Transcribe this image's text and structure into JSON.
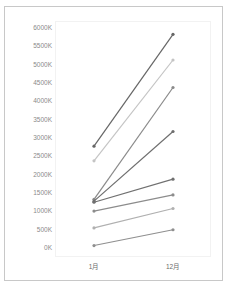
{
  "chart_data": {
    "type": "line",
    "title": "",
    "xlabel": "",
    "ylabel": "",
    "categories": [
      "1月",
      "12月"
    ],
    "yticks": [
      "0K",
      "500K",
      "1000K",
      "1500K",
      "2000K",
      "2500K",
      "3000K",
      "3500K",
      "4000K",
      "4500K",
      "5000K",
      "5500K",
      "6000K"
    ],
    "ylim": [
      0,
      6000
    ],
    "grid": false,
    "legend": "none",
    "series": [
      {
        "name": "series-1",
        "values": [
          2750,
          5800
        ],
        "color": "#666666"
      },
      {
        "name": "series-2",
        "values": [
          2350,
          5100
        ],
        "color": "#c4c4c4"
      },
      {
        "name": "series-3",
        "values": [
          1300,
          4350
        ],
        "color": "#8a8a8a"
      },
      {
        "name": "series-4",
        "values": [
          1250,
          3150
        ],
        "color": "#6e6e6e"
      },
      {
        "name": "series-5",
        "values": [
          1220,
          1850
        ],
        "color": "#707070"
      },
      {
        "name": "series-6",
        "values": [
          980,
          1420
        ],
        "color": "#8c8c8c"
      },
      {
        "name": "series-7",
        "values": [
          520,
          1050
        ],
        "color": "#b0b0b0"
      },
      {
        "name": "series-8",
        "values": [
          40,
          470
        ],
        "color": "#8f8f8f"
      }
    ]
  },
  "axis": {
    "y_labels": [
      "6000K",
      "5500K",
      "5000K",
      "4500K",
      "4000K",
      "3500K",
      "3000K",
      "2500K",
      "2000K",
      "1500K",
      "1000K",
      "500K",
      "0K"
    ],
    "x_labels": [
      "1月",
      "12月"
    ]
  }
}
